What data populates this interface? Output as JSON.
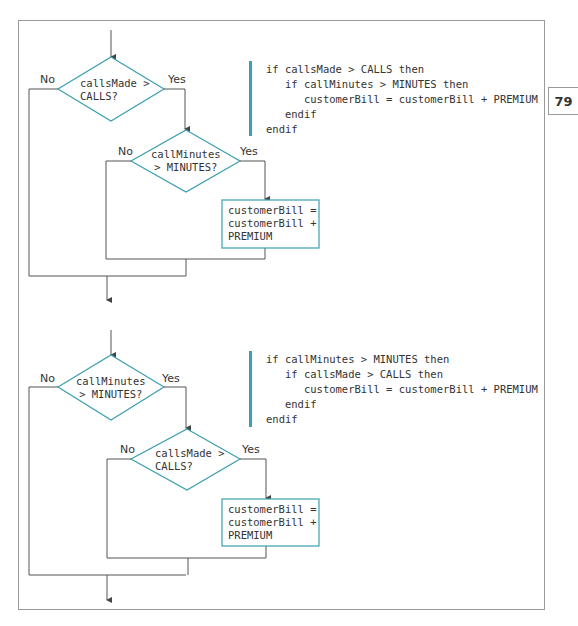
{
  "page_number": "79",
  "colors": {
    "accent": "#3a9fae",
    "line": "#555555",
    "frame": "#9a9a9a",
    "text": "#333333"
  },
  "flowcharts": [
    {
      "outer_decision": {
        "line1": "callsMade >",
        "line2": "CALLS?",
        "no_label": "No",
        "yes_label": "Yes"
      },
      "inner_decision": {
        "line1": "callMinutes",
        "line2": "> MINUTES?",
        "no_label": "No",
        "yes_label": "Yes"
      },
      "process": {
        "line1": "customerBill =",
        "line2": "customerBill +",
        "line3": "PREMIUM"
      },
      "pseudocode": [
        "if callsMade > CALLS then",
        "   if callMinutes > MINUTES then",
        "      customerBill = customerBill + PREMIUM",
        "   endif",
        "endif"
      ]
    },
    {
      "outer_decision": {
        "line1": "callMinutes",
        "line2": "> MINUTES?",
        "no_label": "No",
        "yes_label": "Yes"
      },
      "inner_decision": {
        "line1": "callsMade >",
        "line2": "CALLS?",
        "no_label": "No",
        "yes_label": "Yes"
      },
      "process": {
        "line1": "customerBill =",
        "line2": "customerBill +",
        "line3": "PREMIUM"
      },
      "pseudocode": [
        "if callMinutes > MINUTES then",
        "   if callsMade > CALLS then",
        "      customerBill = customerBill + PREMIUM",
        "   endif",
        "endif"
      ]
    }
  ]
}
